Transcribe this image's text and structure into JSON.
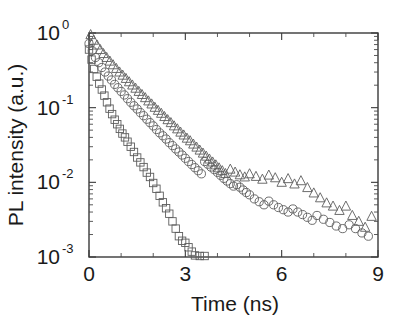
{
  "figure": {
    "background_color": "#ffffff",
    "frame_color": "#3a3a3a",
    "marker_color": "#5d5d5d"
  },
  "axes": {
    "x": {
      "label": "Time (ns)",
      "tick_labels": [
        "0",
        "3",
        "6",
        "9"
      ],
      "tick_values": [
        0,
        3,
        6,
        9
      ],
      "minor_step": 1,
      "range": [
        0,
        9
      ]
    },
    "y": {
      "label": "PL intensity (a.u.)",
      "scale": "log",
      "tick_labels": [
        "10",
        "10",
        "10",
        "10"
      ],
      "tick_exponents": [
        "0",
        "-1",
        "-2",
        "-3"
      ],
      "tick_values": [
        1,
        0.1,
        0.01,
        0.001
      ],
      "range": [
        0.001,
        1
      ]
    }
  },
  "chart_data": {
    "type": "scatter",
    "title": "",
    "xlabel": "Time (ns)",
    "ylabel": "PL intensity (a.u.)",
    "yscale": "log",
    "xlim": [
      0,
      9
    ],
    "ylim": [
      0.001,
      1
    ],
    "grid": false,
    "legend": "none",
    "series": [
      {
        "name": "squares",
        "marker": "square",
        "lifetime_ns": 0.42,
        "x": [
          0.0,
          0.08,
          0.16,
          0.24,
          0.32,
          0.4,
          0.48,
          0.56,
          0.64,
          0.72,
          0.8,
          0.88,
          0.96,
          1.04,
          1.12,
          1.2,
          1.3,
          1.4,
          1.5,
          1.6,
          1.7,
          1.8,
          1.9,
          2.0,
          2.1,
          2.2,
          2.3,
          2.4,
          2.5,
          2.6,
          2.7,
          2.8,
          2.9,
          3.0,
          3.1,
          3.2,
          3.3,
          3.45,
          3.6
        ],
        "y": [
          0.6,
          0.44,
          0.33,
          0.26,
          0.21,
          0.175,
          0.145,
          0.118,
          0.097,
          0.082,
          0.069,
          0.06,
          0.052,
          0.045,
          0.04,
          0.035,
          0.03,
          0.0255,
          0.0215,
          0.0185,
          0.016,
          0.0135,
          0.0118,
          0.0098,
          0.0082,
          0.0066,
          0.0054,
          0.0045,
          0.0038,
          0.003,
          0.0024,
          0.0019,
          0.00165,
          0.00155,
          0.00135,
          0.00118,
          0.00105,
          0.001,
          0.001
        ]
      },
      {
        "name": "circles",
        "marker": "circle",
        "lifetime_ns": 1.32,
        "x": [
          0.0,
          0.1,
          0.2,
          0.3,
          0.4,
          0.5,
          0.6,
          0.7,
          0.8,
          0.9,
          1.0,
          1.1,
          1.2,
          1.3,
          1.4,
          1.5,
          1.6,
          1.7,
          1.8,
          1.9,
          2.0,
          2.1,
          2.2,
          2.3,
          2.4,
          2.5,
          2.6,
          2.7,
          2.8,
          2.9,
          3.0,
          3.1,
          3.2,
          3.3,
          3.4,
          3.5,
          3.6,
          3.7,
          3.8,
          3.9,
          4.0,
          4.1,
          4.2,
          4.3,
          4.4,
          4.5,
          4.6,
          4.7,
          4.8,
          4.9,
          5.0,
          5.15,
          5.3,
          5.45,
          5.6,
          5.75,
          5.9,
          6.05,
          6.2,
          6.35,
          6.5,
          6.65,
          6.8,
          6.95,
          7.1,
          7.3,
          7.5,
          7.7,
          7.9,
          8.1,
          8.3,
          8.5,
          8.7
        ],
        "y": [
          0.72,
          0.58,
          0.47,
          0.4,
          0.345,
          0.3,
          0.265,
          0.235,
          0.205,
          0.185,
          0.165,
          0.148,
          0.132,
          0.118,
          0.106,
          0.096,
          0.086,
          0.078,
          0.07,
          0.063,
          0.057,
          0.051,
          0.046,
          0.042,
          0.038,
          0.034,
          0.031,
          0.028,
          0.0255,
          0.0232,
          0.021,
          0.019,
          0.0173,
          0.0157,
          0.0143,
          0.013,
          0.019,
          0.0175,
          0.016,
          0.0148,
          0.0136,
          0.0124,
          0.0113,
          0.0104,
          0.0096,
          0.0089,
          0.0093,
          0.0086,
          0.0079,
          0.0073,
          0.0068,
          0.006,
          0.0055,
          0.005,
          0.0056,
          0.005,
          0.0046,
          0.0043,
          0.004,
          0.0044,
          0.004,
          0.0037,
          0.0034,
          0.0031,
          0.0036,
          0.0032,
          0.0029,
          0.0026,
          0.0024,
          0.0027,
          0.0024,
          0.0021,
          0.0019
        ]
      },
      {
        "name": "triangles",
        "marker": "triangle",
        "lifetime_ns": 1.72,
        "x": [
          0.05,
          0.15,
          0.25,
          0.35,
          0.45,
          0.55,
          0.65,
          0.75,
          0.85,
          0.95,
          1.05,
          1.15,
          1.25,
          1.35,
          1.45,
          1.55,
          1.65,
          1.75,
          1.85,
          1.95,
          2.05,
          2.15,
          2.25,
          2.35,
          2.45,
          2.55,
          2.65,
          2.75,
          2.85,
          2.95,
          3.05,
          3.15,
          3.25,
          3.35,
          3.45,
          3.55,
          3.65,
          3.75,
          3.85,
          3.95,
          4.05,
          4.15,
          4.25,
          4.4,
          4.55,
          4.7,
          4.85,
          5.0,
          5.2,
          5.4,
          5.6,
          5.8,
          6.0,
          6.2,
          6.4,
          6.6,
          6.8,
          7.0,
          7.2,
          7.4,
          7.6,
          7.8,
          8.0,
          8.2,
          8.4,
          8.6,
          8.8
        ],
        "y": [
          0.95,
          0.8,
          0.69,
          0.6,
          0.53,
          0.47,
          0.42,
          0.375,
          0.335,
          0.3,
          0.272,
          0.246,
          0.222,
          0.201,
          0.182,
          0.165,
          0.15,
          0.136,
          0.123,
          0.112,
          0.101,
          0.092,
          0.084,
          0.076,
          0.069,
          0.063,
          0.057,
          0.052,
          0.047,
          0.043,
          0.039,
          0.036,
          0.0325,
          0.0296,
          0.027,
          0.0246,
          0.0224,
          0.0205,
          0.0187,
          0.0171,
          0.0156,
          0.0143,
          0.0131,
          0.015,
          0.0137,
          0.0126,
          0.0118,
          0.013,
          0.012,
          0.011,
          0.0125,
          0.0115,
          0.01,
          0.0112,
          0.0095,
          0.0105,
          0.0085,
          0.0072,
          0.0062,
          0.0053,
          0.0048,
          0.0042,
          0.0048,
          0.0036,
          0.003,
          0.0025,
          0.0035
        ]
      }
    ]
  }
}
